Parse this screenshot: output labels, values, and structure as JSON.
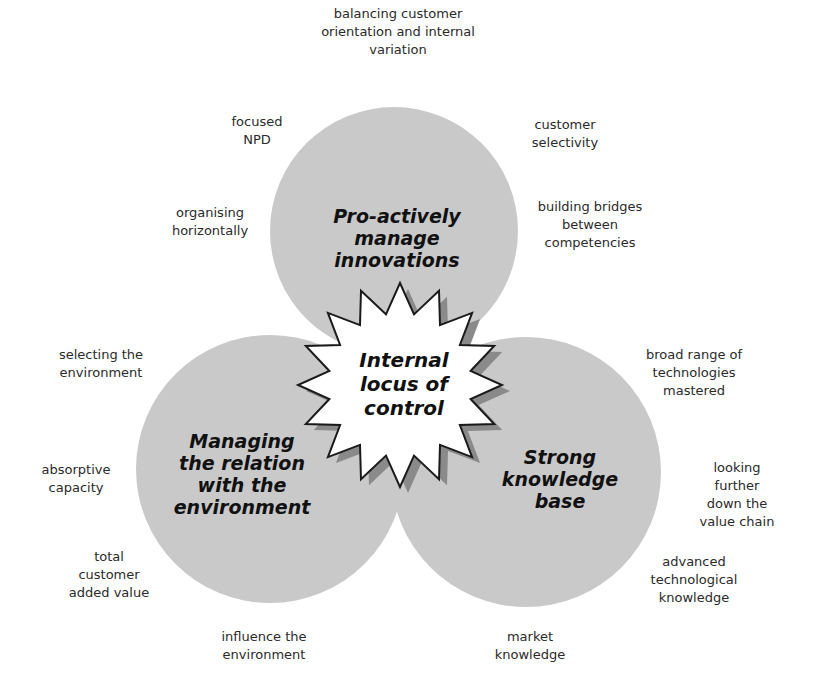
{
  "diagram": {
    "center": {
      "label": "Internal\nlocus of\ncontrol"
    },
    "circles": [
      {
        "id": "top",
        "label": "Pro-actively\nmanage\ninnovations"
      },
      {
        "id": "left",
        "label": "Managing\nthe relation\nwith the\nenvironment"
      },
      {
        "id": "right",
        "label": "Strong\nknowledge\nbase"
      }
    ],
    "annotations": {
      "top": [
        "balancing customer\norientation and internal\nvariation",
        "focused\nNPD",
        "customer\nselectivity",
        "organising\nhorizontally",
        "building bridges\nbetween\ncompetencies"
      ],
      "left": [
        "selecting the\nenvironment",
        "absorptive\ncapacity",
        "total\ncustomer\nadded value",
        "influence the\nenvironment"
      ],
      "right": [
        "broad range of\ntechnologies\nmastered",
        "looking further\ndown the\nvalue chain",
        "advanced\ntechnological\nknowledge",
        "market\nknowledge"
      ]
    },
    "colors": {
      "circle_fill": "#c9c9c9",
      "star_fill": "#ffffff",
      "star_stroke": "#1a1a1a",
      "star_shadow": "#8a8a8a",
      "text": "#2a2a2a"
    }
  }
}
